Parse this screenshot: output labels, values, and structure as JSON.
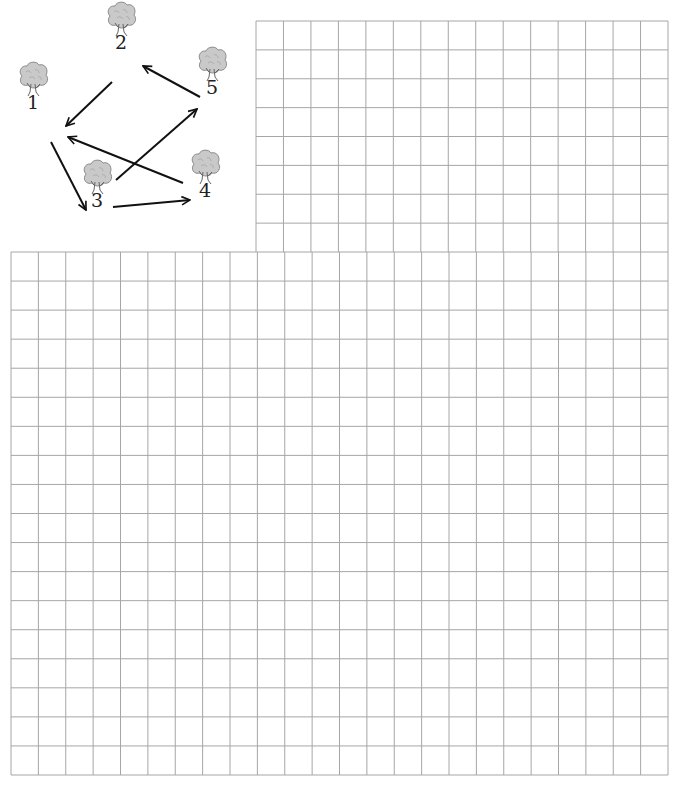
{
  "graph": {
    "nodes": [
      {
        "id": "1",
        "label": "1",
        "x": 33,
        "y": 90
      },
      {
        "id": "2",
        "label": "2",
        "x": 121,
        "y": 30
      },
      {
        "id": "3",
        "label": "3",
        "x": 97,
        "y": 188
      },
      {
        "id": "4",
        "label": "4",
        "x": 205,
        "y": 178
      },
      {
        "id": "5",
        "label": "5",
        "x": 212,
        "y": 75
      }
    ],
    "edges": [
      {
        "from": "2",
        "to": "1",
        "x1": 112,
        "y1": 82,
        "x2": 66,
        "y2": 126
      },
      {
        "from": "5",
        "to": "2",
        "x1": 200,
        "y1": 97,
        "x2": 143,
        "y2": 66
      },
      {
        "from": "1",
        "to": "3",
        "x1": 51,
        "y1": 142,
        "x2": 86,
        "y2": 210
      },
      {
        "from": "3",
        "to": "4",
        "x1": 113,
        "y1": 207,
        "x2": 190,
        "y2": 200
      },
      {
        "from": "3",
        "to": "5",
        "x1": 116,
        "y1": 180,
        "x2": 197,
        "y2": 109
      },
      {
        "from": "4",
        "to": "1",
        "x1": 183,
        "y1": 183,
        "x2": 68,
        "y2": 137
      }
    ]
  },
  "grid": {
    "line_color": "#a6a6a6",
    "cell_w": 27.4,
    "cell_h": 29.0,
    "top_region": {
      "x0": 256,
      "y0": 21,
      "x1": 668,
      "y1": 252
    },
    "full_region": {
      "x0": 11,
      "y0": 252,
      "x1": 668,
      "y1": 775
    }
  }
}
